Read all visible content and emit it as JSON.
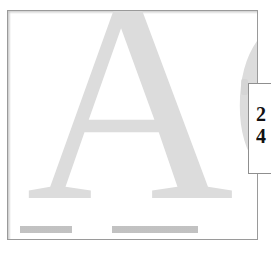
{
  "canvas": {
    "width": 271,
    "height": 253,
    "background_color": "#ffffff"
  },
  "page_frame": {
    "border_color": "#9a9a9a",
    "fill_color": "#ffffff",
    "left": 7,
    "top": 10,
    "width": 251,
    "height": 230
  },
  "artwork": {
    "letters": "AC",
    "style": "serif",
    "color": "#dcdcdc",
    "description": "large ghosted serif capital letters filling the page, clipped at the right edge"
  },
  "callout": {
    "border_color": "#8f8f8f",
    "fill_color": "#ffffff",
    "text_color": "#111111",
    "glyph_lines": [
      "2",
      "4"
    ],
    "note": "overlay box clipped by the right image edge; only partial characters visible"
  }
}
